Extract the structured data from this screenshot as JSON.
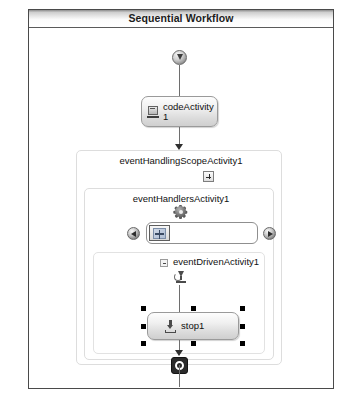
{
  "window": {
    "title": "Sequential Workflow"
  },
  "canvas": {
    "start_icon": "workflow-start-icon",
    "end_icon": "workflow-end-icon"
  },
  "activities": {
    "code_activity": {
      "label": "codeActivity\n1",
      "icon": "code-activity-icon"
    },
    "event_handling_scope": {
      "label": "eventHandlingScopeActivity1",
      "toggle": "expand-box"
    },
    "event_handlers": {
      "label": "eventHandlersActivity1",
      "icon": "gear-icon"
    },
    "event_driven": {
      "label": "eventDrivenActivity1",
      "toggle": "collapse-box",
      "icon": "event-driven-icon"
    },
    "stop_activity": {
      "label": "stop1",
      "icon": "stop-activity-icon",
      "selected": true
    }
  },
  "tabstrip": {
    "left_arrow": "scroll-left-arrow",
    "right_arrow": "scroll-right-arrow",
    "selected_tab": "event-handler-tab-1"
  },
  "colors": {
    "frame_border": "#4a4a4a",
    "title_text": "#1b1b1b",
    "connector": "#6e6e6e",
    "scope_border": "#dddddd",
    "selection_handle": "#000000"
  }
}
